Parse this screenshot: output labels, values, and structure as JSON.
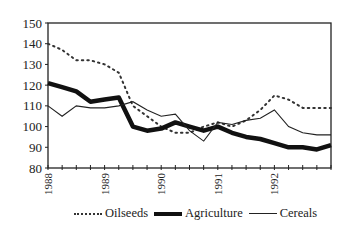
{
  "chart_data": {
    "type": "line",
    "title": "",
    "xlabel": "",
    "ylabel": "",
    "ylim": [
      80,
      150
    ],
    "yticks": [
      80,
      90,
      100,
      110,
      120,
      130,
      140,
      150
    ],
    "xtick_labels": [
      "1988",
      "1989",
      "1990",
      "1991",
      "1992"
    ],
    "x_frequency": "quarterly",
    "x": [
      "1988Q1",
      "1988Q2",
      "1988Q3",
      "1988Q4",
      "1989Q1",
      "1989Q2",
      "1989Q3",
      "1989Q4",
      "1990Q1",
      "1990Q2",
      "1990Q3",
      "1990Q4",
      "1991Q1",
      "1991Q2",
      "1991Q3",
      "1991Q4",
      "1992Q1",
      "1992Q2",
      "1992Q3",
      "1992Q4",
      "1993Q1"
    ],
    "grid": false,
    "legend_position": "bottom",
    "series": [
      {
        "name": "Oilseeds",
        "style": "dotted",
        "values": [
          140,
          137,
          132,
          132,
          130,
          126,
          110,
          105,
          100,
          97,
          97,
          100,
          102,
          100,
          103,
          108,
          115,
          113,
          109,
          109,
          109
        ]
      },
      {
        "name": "Agriculture",
        "style": "thick",
        "values": [
          121,
          119,
          117,
          112,
          113,
          114,
          100,
          98,
          99,
          102,
          100,
          98,
          100,
          97,
          95,
          94,
          92,
          90,
          90,
          89,
          91
        ]
      },
      {
        "name": "Cereals",
        "style": "thin",
        "values": [
          110,
          105,
          110,
          109,
          109,
          110,
          112,
          108,
          105,
          106,
          98,
          93,
          102,
          101,
          103,
          104,
          108,
          100,
          97,
          96,
          96
        ]
      }
    ]
  },
  "legend": {
    "items": [
      "Oilseeds",
      "Agriculture",
      "Cereals"
    ]
  }
}
